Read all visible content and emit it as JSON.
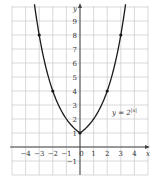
{
  "chart_data": {
    "type": "line",
    "title": "",
    "xlabel": "x",
    "ylabel": "y",
    "xlim": [
      -5,
      5
    ],
    "ylim": [
      -2,
      10
    ],
    "grid": true,
    "x_ticks": [
      "-4",
      "-3",
      "-2",
      "-1",
      "0",
      "1",
      "2",
      "3",
      "4"
    ],
    "y_ticks": [
      "-1",
      "1",
      "2",
      "3",
      "4",
      "5",
      "6",
      "7",
      "8",
      "9"
    ],
    "series": [
      {
        "name": "y = 2^|x|",
        "function": "2^|x|",
        "marked_points": [
          {
            "x": -3,
            "y": 8
          },
          {
            "x": -2,
            "y": 4
          },
          {
            "x": 0,
            "y": 1
          },
          {
            "x": 2,
            "y": 4
          },
          {
            "x": 3,
            "y": 8
          }
        ]
      }
    ],
    "annotation": {
      "base": "y = 2",
      "exponent": "|x|"
    }
  }
}
